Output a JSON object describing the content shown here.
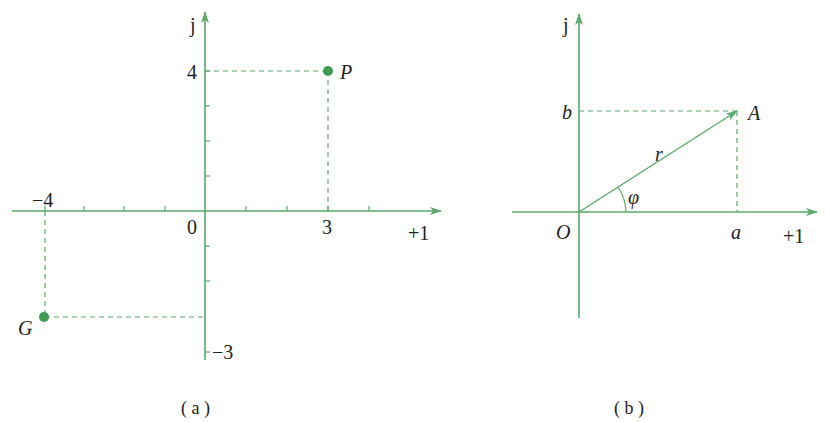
{
  "colors": {
    "axis": "#5aa86a",
    "text": "#222222",
    "point": "#3f9a55"
  },
  "diagram_a": {
    "caption": "( a )",
    "y_axis_label": "j",
    "x_axis_label": "+1",
    "origin_label": "0",
    "x_tick_label_neg": "−4",
    "x_tick_label_pos": "3",
    "y_tick_label_pos": "4",
    "y_tick_label_neg": "−3",
    "point_p": {
      "label": "P",
      "x": 3,
      "y": 4
    },
    "point_g": {
      "label": "G",
      "x": -4,
      "y": -3
    }
  },
  "diagram_b": {
    "caption": "( b )",
    "y_axis_label": "j",
    "x_axis_label": "+1",
    "origin_label": "O",
    "x_component_label": "a",
    "y_component_label": "b",
    "vector_label": "A",
    "magnitude_label": "r",
    "angle_label": "φ"
  }
}
